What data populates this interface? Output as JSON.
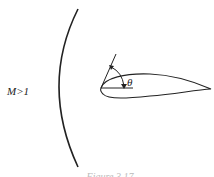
{
  "figure": {
    "mach_label": "M>1",
    "angle_label": "θ",
    "caption": "Figure 3.17",
    "elements": [
      "curved-shock-wave",
      "airfoil",
      "chord-reference-line",
      "tangent-line",
      "angle-arc-arrow"
    ],
    "colors": {
      "stroke": "#222222",
      "background": "#ffffff",
      "caption": "#bbbbbb"
    }
  }
}
